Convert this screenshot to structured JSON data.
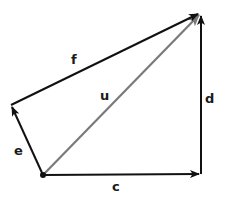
{
  "diagram": {
    "type": "vector-diagram",
    "colors": {
      "black": "#111111",
      "gray": "#7a7a7a",
      "background": "#ffffff"
    },
    "points": {
      "origin": {
        "x": 43,
        "y": 175
      },
      "left": {
        "x": 11,
        "y": 105
      },
      "top_right": {
        "x": 201,
        "y": 13
      },
      "bottom_right": {
        "x": 201,
        "y": 174
      }
    },
    "vectors": [
      {
        "name": "e",
        "label": "e",
        "from": "origin",
        "to": "left",
        "color": "black"
      },
      {
        "name": "f",
        "label": "f",
        "from": "left",
        "to": "top_right",
        "color": "black"
      },
      {
        "name": "u",
        "label": "u",
        "from": "origin",
        "to": "top_right",
        "color": "gray"
      },
      {
        "name": "c",
        "label": "c",
        "from": "origin",
        "to": "bottom_right",
        "color": "black"
      },
      {
        "name": "d",
        "label": "d",
        "from": "bottom_right",
        "to": "top_right",
        "color": "black"
      }
    ],
    "labels": {
      "e": "e",
      "f": "f",
      "u": "u",
      "c": "c",
      "d": "d"
    }
  }
}
